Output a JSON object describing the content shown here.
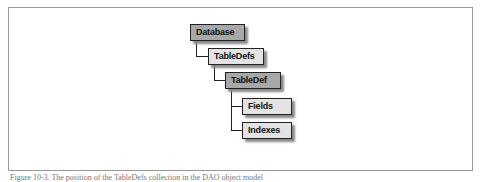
{
  "diagram": {
    "type": "object-hierarchy",
    "nodes": [
      {
        "id": "database",
        "label": "Database",
        "style": "dark",
        "level": 0
      },
      {
        "id": "tabledefs",
        "label": "TableDefs",
        "style": "light",
        "level": 1,
        "parent": "database"
      },
      {
        "id": "tabledef",
        "label": "TableDef",
        "style": "dark",
        "level": 2,
        "parent": "tabledefs"
      },
      {
        "id": "fields",
        "label": "Fields",
        "style": "light",
        "level": 3,
        "parent": "tabledef"
      },
      {
        "id": "indexes",
        "label": "Indexes",
        "style": "light",
        "level": 3,
        "parent": "tabledef"
      }
    ],
    "colors": {
      "dark_fill": "#a8a8a8",
      "light_fill": "#e3e3e3",
      "border": "#222222",
      "shadow": "#8a8a8a"
    }
  },
  "caption": "Figure 10-3. The position of the TableDefs collection in the DAO object model"
}
